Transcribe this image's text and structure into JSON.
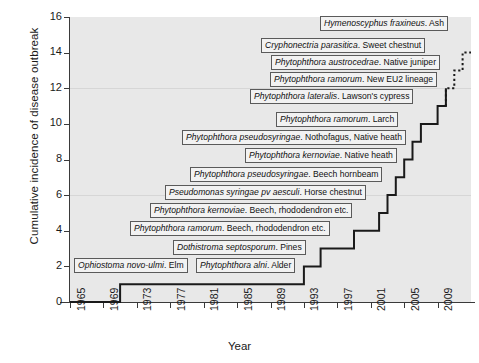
{
  "chart_data": {
    "type": "line",
    "subtype": "step",
    "title": "",
    "xlabel": "Year",
    "ylabel": "Cumulative incidence of disease outbreak",
    "xlim": [
      1965,
      2013
    ],
    "ylim": [
      0,
      16
    ],
    "ytick_values": [
      0,
      2,
      4,
      6,
      8,
      10,
      12,
      14,
      16
    ],
    "xtick_values": [
      1965,
      1969,
      1973,
      1977,
      1981,
      1985,
      1989,
      1993,
      1997,
      2001,
      2005,
      2009
    ],
    "grid": "horizontal-faint",
    "legend": "none",
    "x": [
      1965,
      1971,
      1971,
      1993,
      1993,
      1995,
      1995,
      1999,
      1999,
      2002,
      2002,
      2003,
      2003,
      2004,
      2004,
      2005,
      2005,
      2006,
      2006,
      2007,
      2007,
      2009,
      2009,
      2010,
      2010,
      2011,
      2011,
      2012,
      2012,
      2013
    ],
    "values": [
      0,
      0,
      1,
      1,
      2,
      2,
      3,
      3,
      4,
      4,
      5,
      5,
      6,
      6,
      7,
      7,
      8,
      8,
      9,
      9,
      10,
      10,
      11,
      11,
      12,
      12,
      13,
      13,
      14,
      14
    ],
    "series": [
      {
        "name": "Cumulative disease outbreaks",
        "style_solid_up_to": 11,
        "style_dotted_above": 11,
        "points": [
          {
            "n": 1,
            "year": 1971,
            "pathogen": "Ophiostoma novo-ulmi",
            "host": "Elm"
          },
          {
            "n": 2,
            "year": 1993,
            "pathogen": "Phytophthora alni",
            "host": "Alder"
          },
          {
            "n": 3,
            "year": 1995,
            "pathogen": "Dothistroma septosporum",
            "host": "Pines"
          },
          {
            "n": 4,
            "year": 1999,
            "pathogen": "Phytophthora ramorum",
            "host": "Beech, rhododendron etc."
          },
          {
            "n": 5,
            "year": 2002,
            "pathogen": "Phytophthora kernoviae",
            "host": "Beech, rhododendron etc."
          },
          {
            "n": 6,
            "year": 2003,
            "pathogen": "Pseudomonas syringae pv aesculi",
            "host": "Horse chestnut"
          },
          {
            "n": 7,
            "year": 2004,
            "pathogen": "Phytophthora pseudosyringae",
            "host": "Beech hornbeam"
          },
          {
            "n": 8,
            "year": 2005,
            "pathogen": "Phytophthora kernoviae",
            "host": "Native heath"
          },
          {
            "n": 9,
            "year": 2006,
            "pathogen": "Phytophthora pseudosyringae",
            "host": "Nothofagus, Native heath"
          },
          {
            "n": 10,
            "year": 2007,
            "pathogen": "Phytophthora ramorum",
            "host": "Larch"
          },
          {
            "n": 11,
            "year": 2009,
            "pathogen": "Phytophthora lateralis",
            "host": "Lawson's cypress"
          },
          {
            "n": 12,
            "year": 2010,
            "pathogen": "Phytophthora ramorum",
            "host": "New EU2 lineage"
          },
          {
            "n": 13,
            "year": 2011,
            "pathogen": "Phytophthora austrocedrae",
            "host": "Native juniper"
          },
          {
            "n": 14,
            "year": 2012,
            "pathogen": "Cryphonectria parasitica",
            "host": "Sweet chestnut"
          },
          {
            "n": 15,
            "year": 2013,
            "pathogen": "Hymenoscyphus fraxineus",
            "host": "Ash"
          }
        ]
      }
    ]
  },
  "axes": {
    "y_title": "Cumulative incidence of disease outbreak",
    "x_title": "Year",
    "y_ticks": [
      "0",
      "2",
      "4",
      "6",
      "8",
      "10",
      "12",
      "14",
      "16"
    ],
    "x_ticks": [
      "1965",
      "1969",
      "1973",
      "1977",
      "1981",
      "1985",
      "1989",
      "1993",
      "1997",
      "2001",
      "2005",
      "2009"
    ]
  },
  "annotations": [
    {
      "id": "ash",
      "genus": "Hymenoscyphus fraxineus",
      "rest": ". Ash"
    },
    {
      "id": "sweetchestnut",
      "genus": "Cryphonectria parasitica",
      "rest": ". Sweet chestnut"
    },
    {
      "id": "juniper",
      "genus": "Phytophthora austrocedrae",
      "rest": ". Native juniper"
    },
    {
      "id": "eu2",
      "genus": "Phytophthora ramorum",
      "rest": ". New EU2 lineage"
    },
    {
      "id": "cypress",
      "genus": "Phytophthora lateralis",
      "rest": ". Lawson's cypress"
    },
    {
      "id": "larch",
      "genus": "Phytophthora ramorum",
      "rest": ". Larch"
    },
    {
      "id": "nothofagus",
      "genus": "Phytophthora pseudosyringae",
      "rest": ". Nothofagus, Native heath"
    },
    {
      "id": "nativeheath",
      "genus": "Phytophthora kernoviae",
      "rest": ". Native heath"
    },
    {
      "id": "hornbeam",
      "genus": "Phytophthora pseudosyringae",
      "rest": ". Beech hornbeam"
    },
    {
      "id": "horsechestnut",
      "genus": "Pseudomonas syringae pv aesculi",
      "rest": ". Horse chestnut"
    },
    {
      "id": "kernbeech",
      "genus": "Phytophthora kernoviae",
      "rest": ". Beech, rhododendron etc."
    },
    {
      "id": "ramobeech",
      "genus": "Phytophthora ramorum",
      "rest": ". Beech, rhododendron etc."
    },
    {
      "id": "pines",
      "genus": "Dothistroma septosporum",
      "rest": ". Pines"
    },
    {
      "id": "alder",
      "genus": "Phytophthora alni",
      "rest": ". Alder"
    },
    {
      "id": "elm",
      "genus": "Ophiostoma novo-ulmi",
      "rest": ". Elm"
    }
  ],
  "colors": {
    "plot_background": "#e8e8e8",
    "line": "#1a1a1a",
    "axis": "#3a3a3a",
    "label_box_fill": "#f2f2f2",
    "label_box_border": "#5a5a5a",
    "grid": "#d6d6d6"
  }
}
